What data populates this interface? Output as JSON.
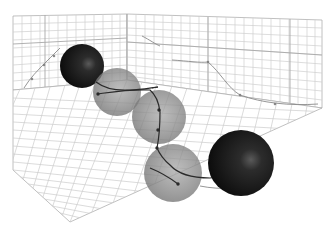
{
  "scene": {
    "description": "3D render of five spheres along a curved trajectory inside an open gridded box",
    "background": "#ffffff",
    "grid_color": "#c8c8c8",
    "grid_major_color": "#a8a8a8",
    "trajectory_color": "#2a2a2a",
    "projection_color": "#8a8a8a",
    "spheres": [
      {
        "id": "start",
        "kind": "solid",
        "color": "#1c1c1c",
        "cx": 82,
        "cy": 66,
        "r": 22
      },
      {
        "id": "mid-1",
        "kind": "translucent",
        "color": "#8c8c8c",
        "cx": 117,
        "cy": 92,
        "r": 24
      },
      {
        "id": "mid-2",
        "kind": "translucent",
        "color": "#8c8c8c",
        "cx": 159,
        "cy": 117,
        "r": 27
      },
      {
        "id": "mid-3",
        "kind": "translucent",
        "color": "#8c8c8c",
        "cx": 173,
        "cy": 173,
        "r": 29
      },
      {
        "id": "end",
        "kind": "solid",
        "color": "#1c1c1c",
        "cx": 241,
        "cy": 163,
        "r": 33
      }
    ]
  }
}
